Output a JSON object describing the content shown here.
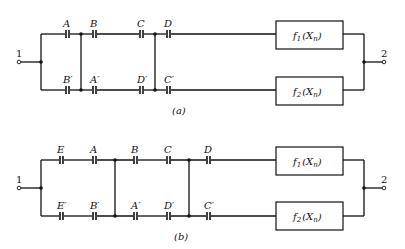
{
  "diagram_a": {
    "caption": "(a)",
    "terminal_in": "1",
    "terminal_out": "2",
    "top_caps": [
      "A",
      "B",
      "C",
      "D"
    ],
    "bottom_caps": [
      "B′",
      "A′",
      "D′",
      "C′"
    ],
    "box_top": {
      "f": "f",
      "sub": "1",
      "arg": "(X",
      "argsub": "n",
      "close": ")"
    },
    "box_bottom": {
      "f": "f",
      "sub": "2",
      "arg": "(X",
      "argsub": "n",
      "close": ")"
    }
  },
  "diagram_b": {
    "caption": "(b)",
    "terminal_in": "1",
    "terminal_out": "2",
    "top_caps": [
      "E",
      "A",
      "B",
      "C",
      "D"
    ],
    "bottom_caps": [
      "E′",
      "B′",
      "A′",
      "D′",
      "C′"
    ],
    "box_top": {
      "f": "f",
      "sub": "1",
      "arg": "(X",
      "argsub": "n",
      "close": ")"
    },
    "box_bottom": {
      "f": "f",
      "sub": "2",
      "arg": "(X",
      "argsub": "n",
      "close": ")"
    }
  }
}
